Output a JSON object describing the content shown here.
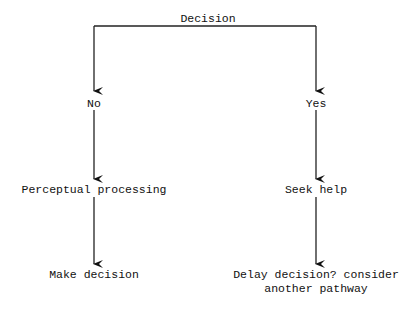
{
  "diagram": {
    "type": "decision-flowchart",
    "root": {
      "label": "Decision"
    },
    "branches": [
      {
        "label": "No",
        "steps": [
          "Perceptual processing",
          "Make decision"
        ]
      },
      {
        "label": "Yes",
        "steps": [
          "Seek help",
          "Delay decision? consider\nanother pathway"
        ]
      }
    ],
    "nodes": {
      "decision": "Decision",
      "no": "No",
      "yes": "Yes",
      "perceptual_processing": "Perceptual processing",
      "make_decision": "Make decision",
      "seek_help": "Seek help",
      "delay_line1": "Delay decision? consider",
      "delay_line2": "another pathway"
    },
    "colors": {
      "line": "#222222",
      "text": "#111111",
      "background": "#ffffff"
    }
  }
}
